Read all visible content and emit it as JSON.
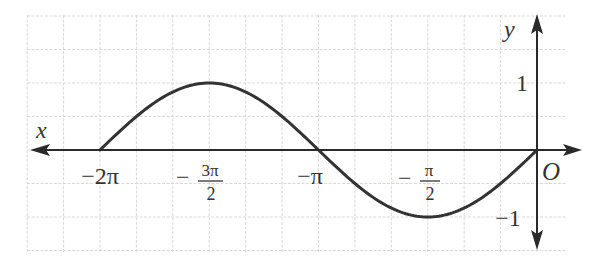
{
  "chart_data": {
    "type": "line",
    "title": "",
    "function": "y = sin x",
    "xlabel": "x",
    "ylabel": "y",
    "origin_label": "O",
    "x_direction": "x-axis arrow points left (positive x label placed at left end)",
    "xlim_radians": [
      -6.806,
      0.524
    ],
    "ylim": [
      -1.5,
      1.3
    ],
    "grid": true,
    "grid_step_x": "π/6",
    "grid_step_y": 0.5,
    "x_ticks": [
      {
        "value": -6.2832,
        "label": "−2π"
      },
      {
        "value": -4.7124,
        "label": "−3π/2",
        "num": "3π",
        "den": "2"
      },
      {
        "value": -3.1416,
        "label": "−π"
      },
      {
        "value": -1.5708,
        "label": "−π/2",
        "num": "π",
        "den": "2"
      }
    ],
    "y_ticks": [
      {
        "value": 1,
        "label": "1"
      },
      {
        "value": -1,
        "label": "−1"
      }
    ],
    "series": [
      {
        "name": "y = sin x on [−2π, 0]",
        "x": [
          -6.2832,
          -5.4978,
          -4.7124,
          -3.927,
          -3.1416,
          -2.3562,
          -1.5708,
          -0.7854,
          0
        ],
        "y": [
          0,
          0.7071,
          1,
          0.7071,
          0,
          -0.7071,
          -1,
          -0.7071,
          0
        ]
      }
    ],
    "key_points": [
      {
        "x": "−2π",
        "y": 0
      },
      {
        "x": "−3π/2",
        "y": 1
      },
      {
        "x": "−π",
        "y": 0
      },
      {
        "x": "−π/2",
        "y": -1
      },
      {
        "x": "0",
        "y": 0
      }
    ]
  },
  "labels": {
    "x": "x",
    "y": "y",
    "origin": "O",
    "minus": "−",
    "neg_two_pi": "−2π",
    "neg_pi": "−π",
    "three_pi": "3π",
    "pi": "π",
    "two": "2",
    "one": "1",
    "neg_one": "−1"
  },
  "colors": {
    "grid": "#d9d9d9",
    "axis": "#2a2a2a",
    "curve": "#333333",
    "text": "#333333"
  }
}
